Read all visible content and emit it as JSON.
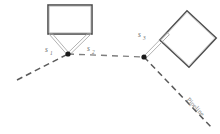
{
  "figure": {
    "type": "technical-line-diagram",
    "background_color": "#ffffff"
  },
  "colors": {
    "structure_outline": "#555555",
    "structure_outline_light": "#999999",
    "connector_grey": "#a9a9a9",
    "dashed_line": "#5a5a5a",
    "node_fill": "#1a1a1a",
    "label_text": "#6b6b6b",
    "pipeline_text": "#8a8a8a"
  },
  "shapes": {
    "left_rectangle": {
      "name": "left-building",
      "x": 48,
      "y": 5,
      "width": 44,
      "height": 29,
      "rotation_deg": 0
    },
    "right_square": {
      "name": "right-building",
      "center_x": 188,
      "center_y": 39,
      "size": 40,
      "rotation_deg": 43
    }
  },
  "nodes": [
    {
      "name": "node-left",
      "x": 68,
      "y": 54,
      "radius": 2.6
    },
    {
      "name": "node-right",
      "x": 144,
      "y": 57,
      "radius": 2.6
    }
  ],
  "labels": {
    "s1": {
      "base": "s",
      "sub": "1",
      "x": 47,
      "y": 51
    },
    "s2": {
      "base": "s",
      "sub": "2",
      "x": 88,
      "y": 50
    },
    "s3": {
      "base": "s",
      "sub": "3",
      "x": 139,
      "y": 36
    },
    "pipeline": {
      "text": "Pipeline",
      "x": 190,
      "y": 107,
      "rotation_deg": 47
    }
  },
  "dashed_paths": [
    {
      "name": "lower-left-dashed-line",
      "x1": 17,
      "y1": 80,
      "x2": 68,
      "y2": 54
    },
    {
      "name": "centre-dashed-line",
      "x1": 68,
      "y1": 54,
      "x2": 144,
      "y2": 57
    },
    {
      "name": "pipeline-dashed-line",
      "x1": 144,
      "y1": 57,
      "x2": 212,
      "y2": 128
    }
  ],
  "connectors": [
    {
      "name": "connector-s1",
      "from": "left-building-bottom-left",
      "to": "node-left"
    },
    {
      "name": "connector-s2",
      "from": "left-building-bottom-right",
      "to": "node-left"
    },
    {
      "name": "connector-s3",
      "from": "node-right",
      "to": "right-building-left-corner"
    }
  ]
}
